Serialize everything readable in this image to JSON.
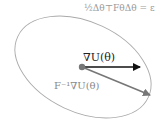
{
  "diagram": {
    "constraint_label": "½Δθ⊤FθΔθ = ε",
    "gradient_label": "∇U(θ)",
    "natural_gradient_label": "F⁻¹∇U(θ)",
    "colors": {
      "ellipse": "#aaaaaa",
      "gradient_arrow": "#111111",
      "natural_gradient_arrow": "#777777",
      "origin_dot": "#777777"
    }
  }
}
